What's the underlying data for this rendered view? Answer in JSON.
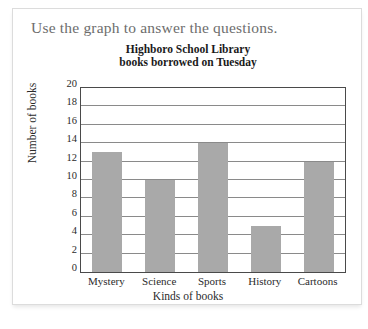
{
  "worksheet": {
    "instruction": "Use the graph to answer the questions."
  },
  "chart_data": {
    "type": "bar",
    "title": "Highboro School Library books borrowed on Tuesday",
    "title_lines": [
      "Highboro School Library",
      "books borrowed on Tuesday"
    ],
    "categories": [
      "Mystery",
      "Science",
      "Sports",
      "History",
      "Cartoons"
    ],
    "values": [
      13,
      10,
      14,
      5,
      12
    ],
    "xlabel": "Kinds of books",
    "ylabel": "Number of books",
    "ylim": [
      0,
      20
    ],
    "ytick_step": 2,
    "yticks": [
      20,
      18,
      16,
      14,
      12,
      10,
      8,
      6,
      4,
      2,
      0
    ],
    "grid": true,
    "legend": false,
    "bar_color": "#a9a9a9",
    "axis_color": "#4a4a4a",
    "gridline_color": "#8a8a8a"
  }
}
